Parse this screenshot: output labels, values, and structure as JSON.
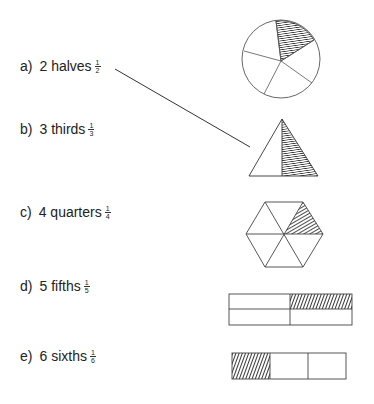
{
  "items": [
    {
      "letter": "a)",
      "label": "2 halves",
      "num": "1",
      "den": "2"
    },
    {
      "letter": "b)",
      "label": "3 thirds",
      "num": "1",
      "den": "3"
    },
    {
      "letter": "c)",
      "label": "4 quarters",
      "num": "1",
      "den": "4"
    },
    {
      "letter": "d)",
      "label": "5 fifths",
      "num": "1",
      "den": "5"
    },
    {
      "letter": "e)",
      "label": "6 sixths",
      "num": "1",
      "den": "6"
    }
  ],
  "shapes": [
    {
      "name": "circle-fifths",
      "parts": 5,
      "shaded": 1
    },
    {
      "name": "triangle-halves",
      "parts": 2,
      "shaded": 1
    },
    {
      "name": "hexagon-sixths",
      "parts": 6,
      "shaded": 1
    },
    {
      "name": "rectangle-quarters",
      "parts": 4,
      "shaded": 1
    },
    {
      "name": "rectangle-thirds",
      "parts": 3,
      "shaded": 1
    }
  ],
  "connector": {
    "from": "a) 2 halves",
    "to": "triangle-halves"
  },
  "colors": {
    "line": "#333333",
    "hatch": "#222222"
  }
}
